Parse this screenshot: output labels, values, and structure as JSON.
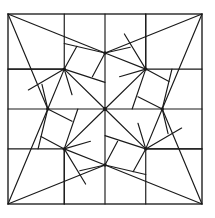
{
  "figure": {
    "title": "Geometric quilt block",
    "stroke_color": "#1a1a1a",
    "background_color": "#ffffff",
    "frame": {
      "left": 8,
      "top": 14,
      "right": 202,
      "bottom": 204
    },
    "center": {
      "x": 105,
      "y": 109
    },
    "symmetry": "4-fold rotational"
  }
}
